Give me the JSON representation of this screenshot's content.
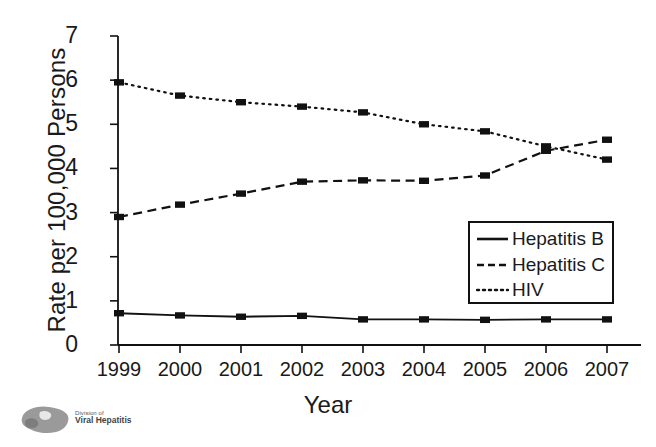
{
  "chart_data": {
    "type": "line",
    "title": "",
    "xlabel": "Year",
    "ylabel": "Rate per 100,000 Persons",
    "categories": [
      "1999",
      "2000",
      "2001",
      "2002",
      "2003",
      "2004",
      "2005",
      "2006",
      "2007"
    ],
    "xticklabels": [
      "1999",
      "2000",
      "2001",
      "2002",
      "2003",
      "2004",
      "2005",
      "2006",
      "2007"
    ],
    "yticklabels": [
      "0",
      "1",
      "2",
      "3",
      "4",
      "5",
      "6",
      "7"
    ],
    "ylim": [
      0,
      7
    ],
    "ytick_values": [
      0,
      1,
      2,
      3,
      4,
      5,
      6,
      7
    ],
    "grid": false,
    "legend_position": "inside-lower-right",
    "series": [
      {
        "name": "Hepatitis B",
        "style": "solid",
        "color": "#111111",
        "values": [
          0.72,
          0.67,
          0.64,
          0.66,
          0.58,
          0.58,
          0.57,
          0.58,
          0.58
        ]
      },
      {
        "name": "Hepatitis C",
        "style": "dashed",
        "color": "#111111",
        "values": [
          2.9,
          3.18,
          3.43,
          3.7,
          3.73,
          3.72,
          3.84,
          4.4,
          4.65
        ]
      },
      {
        "name": "HIV",
        "style": "dotted",
        "color": "#111111",
        "values": [
          5.95,
          5.65,
          5.5,
          5.4,
          5.27,
          5.0,
          4.84,
          4.5,
          4.2
        ]
      }
    ]
  },
  "legend": {
    "items": [
      {
        "label": "Hepatitis B"
      },
      {
        "label": "Hepatitis C"
      },
      {
        "label": "HIV"
      }
    ]
  },
  "logo": {
    "line1": "Division of",
    "line2": "Viral Hepatitis",
    "icon": "liver-icon"
  }
}
